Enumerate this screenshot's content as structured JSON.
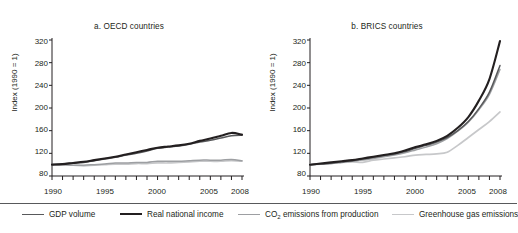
{
  "figure": {
    "background": "#ffffff",
    "text_color": "#231f20"
  },
  "panels": [
    {
      "id": "a",
      "title": "a. OECD countries"
    },
    {
      "id": "b",
      "title": "b. BRICS countries"
    }
  ],
  "axis": {
    "ylabel": "Index (1990 = 1)",
    "yticks": [
      "80",
      "120",
      "160",
      "200",
      "240",
      "280",
      "320"
    ],
    "xticks_labeled": [
      "1990",
      "1995",
      "2000",
      "2005",
      "2008"
    ]
  },
  "legend": {
    "items": [
      {
        "label": "GDP volume",
        "color": "#58595b",
        "width": 1.4
      },
      {
        "label": "Real national income",
        "color": "#231f20",
        "width": 2.2
      },
      {
        "label": "CO",
        "sub": "2",
        "label_rest": " emissions from production",
        "color": "#9d9fa2",
        "width": 1.4
      },
      {
        "label": "Greenhouse gas emissions",
        "color": "#c7c8ca",
        "width": 1.6
      }
    ]
  },
  "chart_data": {
    "type": "line",
    "title": "",
    "xlabel": "",
    "ylabel": "Index (1990 = 1)",
    "xlim": [
      1990,
      2008
    ],
    "ylim": [
      80,
      320
    ],
    "grid": false,
    "legend_position": "bottom",
    "x": [
      1990,
      1991,
      1992,
      1993,
      1994,
      1995,
      1996,
      1997,
      1998,
      1999,
      2000,
      2001,
      2002,
      2003,
      2004,
      2005,
      2006,
      2007,
      2008
    ],
    "panels": [
      {
        "name": "a. OECD countries",
        "series": [
          {
            "name": "GDP volume",
            "color": "#58595b",
            "values": [
              100,
              101,
              103,
              104,
              107,
              110,
              113,
              117,
              120,
              124,
              129,
              131,
              133,
              136,
              140,
              143,
              147,
              151,
              152
            ]
          },
          {
            "name": "Real national income",
            "color": "#231f20",
            "values": [
              100,
              101,
              103,
              105,
              108,
              111,
              114,
              118,
              122,
              126,
              130,
              132,
              134,
              137,
              142,
              146,
              151,
              156,
              153
            ]
          },
          {
            "name": "CO2 emissions from production",
            "color": "#9d9fa2",
            "values": [
              100,
              100,
              99,
              99,
              100,
              101,
              103,
              103,
              104,
              104,
              106,
              106,
              106,
              107,
              108,
              108,
              108,
              109,
              107
            ]
          },
          {
            "name": "Greenhouse gas emissions",
            "color": "#c7c8ca",
            "values": [
              100,
              100,
              99,
              98,
              99,
              100,
              101,
              101,
              102,
              102,
              103,
              103,
              104,
              105,
              106,
              106,
              106,
              107,
              106
            ]
          }
        ]
      },
      {
        "name": "b. BRICS countries",
        "series": [
          {
            "name": "GDP volume",
            "color": "#58595b",
            "values": [
              100,
              101,
              103,
              105,
              107,
              110,
              113,
              116,
              119,
              123,
              129,
              134,
              140,
              148,
              160,
              176,
              199,
              228,
              275
            ]
          },
          {
            "name": "Real national income",
            "color": "#231f20",
            "values": [
              100,
              102,
              104,
              106,
              108,
              111,
              114,
              117,
              120,
              125,
              131,
              136,
              142,
              151,
              165,
              184,
              213,
              251,
              318
            ]
          },
          {
            "name": "CO2 emissions from production",
            "color": "#9d9fa2",
            "values": [
              100,
              101,
              102,
              104,
              106,
              108,
              111,
              114,
              117,
              121,
              126,
              131,
              137,
              146,
              159,
              175,
              197,
              224,
              268
            ]
          },
          {
            "name": "Greenhouse gas emissions",
            "color": "#c7c8ca",
            "values": [
              100,
              101,
              102,
              104,
              105,
              104,
              108,
              110,
              112,
              114,
              117,
              118,
              119,
              122,
              134,
              148,
              162,
              176,
              193
            ]
          }
        ]
      }
    ]
  }
}
